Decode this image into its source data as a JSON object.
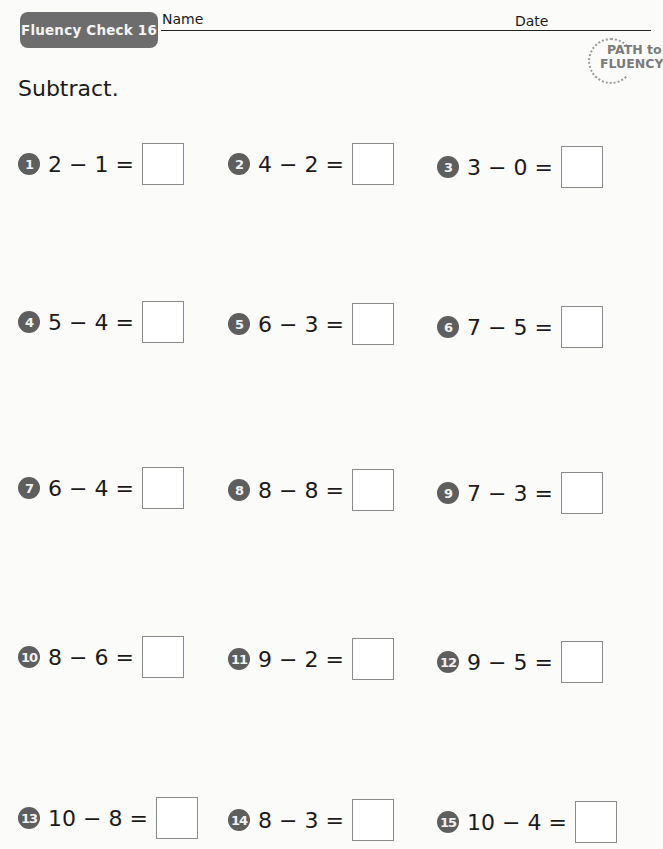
{
  "header": {
    "badge": "Fluency Check 16",
    "name_label": "Name",
    "date_label": "Date",
    "logo_line1": "PATH to",
    "logo_line2": "FLUENCY"
  },
  "instructions": "Subtract.",
  "colors": {
    "badge_bg": "#6d6d6d",
    "number_circle": "#5e5e5e",
    "logo_text": "#7a7a7a",
    "box_border": "#8a8a8a"
  },
  "problems": [
    {
      "n": "1",
      "expr": "2 − 1 =",
      "answer": ""
    },
    {
      "n": "2",
      "expr": "4 − 2 =",
      "answer": ""
    },
    {
      "n": "3",
      "expr": "3 − 0 =",
      "answer": ""
    },
    {
      "n": "4",
      "expr": "5 − 4 =",
      "answer": ""
    },
    {
      "n": "5",
      "expr": "6 − 3 =",
      "answer": ""
    },
    {
      "n": "6",
      "expr": "7 − 5 =",
      "answer": ""
    },
    {
      "n": "7",
      "expr": "6 − 4 =",
      "answer": ""
    },
    {
      "n": "8",
      "expr": "8 − 8 =",
      "answer": ""
    },
    {
      "n": "9",
      "expr": "7 − 3 =",
      "answer": ""
    },
    {
      "n": "10",
      "expr": "8 − 6 =",
      "answer": ""
    },
    {
      "n": "11",
      "expr": "9 − 2 =",
      "answer": ""
    },
    {
      "n": "12",
      "expr": "9 − 5 =",
      "answer": ""
    },
    {
      "n": "13",
      "expr": "10 − 8 =",
      "answer": ""
    },
    {
      "n": "14",
      "expr": "8 − 3 =",
      "answer": ""
    },
    {
      "n": "15",
      "expr": "10 − 4 =",
      "answer": ""
    }
  ]
}
